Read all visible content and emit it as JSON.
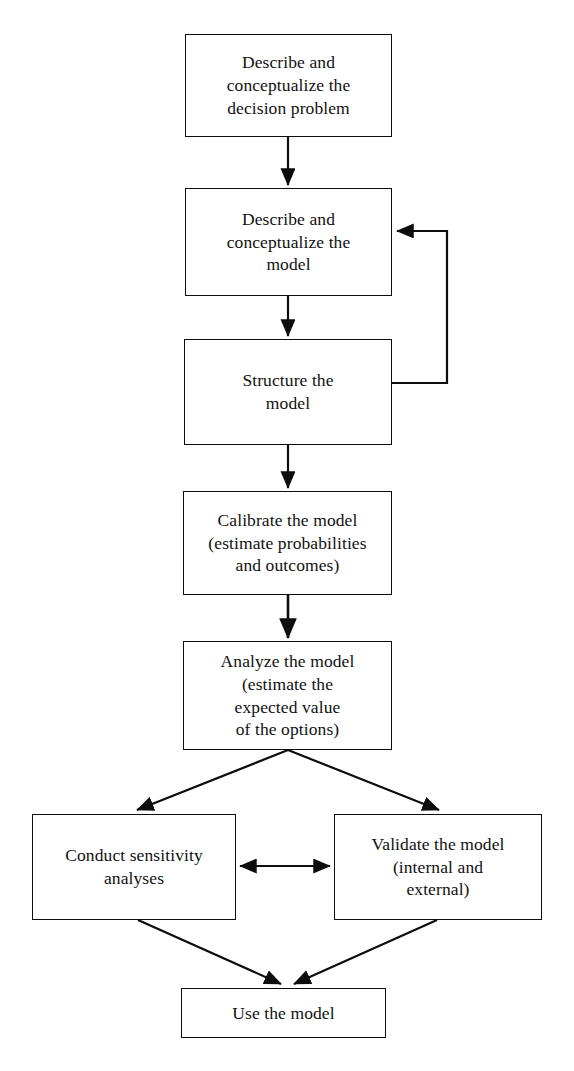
{
  "diagram": {
    "background_color": "#ffffff",
    "line_color": "#0d0d0d",
    "text_color": "#111111",
    "nodes": [
      {
        "id": "describe-decision-problem",
        "label": "Describe and\nconceptualize the\ndecision problem",
        "x": 185,
        "y": 34,
        "w": 207,
        "h": 103
      },
      {
        "id": "describe-model",
        "label": "Describe and\nconceptualize the\nmodel",
        "x": 185,
        "y": 188,
        "w": 207,
        "h": 108
      },
      {
        "id": "structure-model",
        "label": "Structure the\nmodel",
        "x": 184,
        "y": 339,
        "w": 208,
        "h": 106
      },
      {
        "id": "calibrate-model",
        "label": "Calibrate the model\n(estimate probabilities\nand outcomes)",
        "x": 183,
        "y": 491,
        "w": 209,
        "h": 104
      },
      {
        "id": "analyze-model",
        "label": "Analyze the model\n(estimate the\nexpected value\nof the options)",
        "x": 183,
        "y": 641,
        "w": 209,
        "h": 109
      },
      {
        "id": "conduct-sensitivity-analyses",
        "label": "Conduct sensitivity\nanalyses",
        "x": 32,
        "y": 814,
        "w": 204,
        "h": 106
      },
      {
        "id": "validate-model",
        "label": "Validate the model\n(internal and\nexternal)",
        "x": 334,
        "y": 814,
        "w": 208,
        "h": 106
      },
      {
        "id": "use-model",
        "label": "Use the model",
        "x": 181,
        "y": 988,
        "w": 205,
        "h": 50
      }
    ],
    "edges": [
      {
        "id": "edge-problem-to-describe-model",
        "from": "describe-decision-problem",
        "to": "describe-model",
        "kind": "straight-arrow",
        "direction": "down"
      },
      {
        "id": "edge-describe-model-to-structure",
        "from": "describe-model",
        "to": "structure-model",
        "kind": "straight-arrow",
        "direction": "down"
      },
      {
        "id": "edge-structure-feedback-to-describe-model",
        "from": "structure-model",
        "to": "describe-model",
        "kind": "feedback-loop",
        "direction": "right-up-left"
      },
      {
        "id": "edge-structure-to-calibrate",
        "from": "structure-model",
        "to": "calibrate-model",
        "kind": "straight-arrow",
        "direction": "down"
      },
      {
        "id": "edge-calibrate-to-analyze",
        "from": "calibrate-model",
        "to": "analyze-model",
        "kind": "straight-arrow",
        "direction": "down"
      },
      {
        "id": "edge-analyze-to-sensitivity",
        "from": "analyze-model",
        "to": "conduct-sensitivity-analyses",
        "kind": "diagonal-arrow",
        "direction": "down-left"
      },
      {
        "id": "edge-analyze-to-validate",
        "from": "analyze-model",
        "to": "validate-model",
        "kind": "diagonal-arrow",
        "direction": "down-right"
      },
      {
        "id": "edge-sensitivity-validate-bidirectional",
        "from": "conduct-sensitivity-analyses",
        "to": "validate-model",
        "kind": "double-headed-arrow",
        "direction": "horizontal"
      },
      {
        "id": "edge-sensitivity-to-use",
        "from": "conduct-sensitivity-analyses",
        "to": "use-model",
        "kind": "diagonal-arrow",
        "direction": "down-right"
      },
      {
        "id": "edge-validate-to-use",
        "from": "validate-model",
        "to": "use-model",
        "kind": "diagonal-arrow",
        "direction": "down-left"
      }
    ]
  }
}
